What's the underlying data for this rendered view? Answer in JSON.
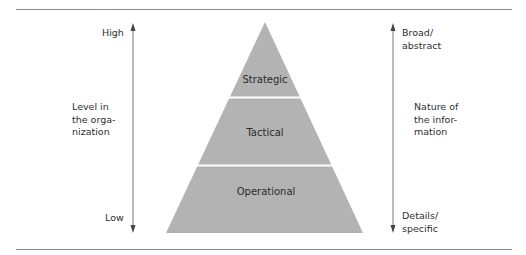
{
  "diagram": {
    "type": "pyramid",
    "fill_color": "#b3b3b3",
    "divider_color": "#ffffff",
    "layers": [
      {
        "label": "Strategic"
      },
      {
        "label": "Tactical"
      },
      {
        "label": "Operational"
      }
    ],
    "left_axis": {
      "top_label": "High",
      "bottom_label": "Low",
      "title": "Level in\nthe orga-\nnization"
    },
    "right_axis": {
      "top_label": "Broad/\nabstract",
      "bottom_label": "Details/\nspecific",
      "title": "Nature of\nthe infor-\nmation"
    }
  }
}
